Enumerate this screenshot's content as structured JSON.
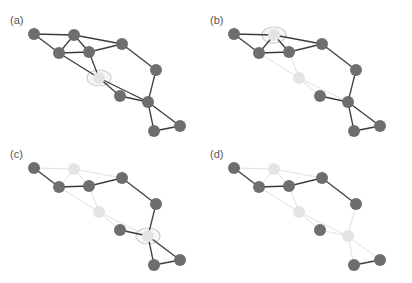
{
  "figure": {
    "colors": {
      "node_active": "#6e6e6e",
      "node_removed": "#e4e4e4",
      "edge_active": "#3c3c3c",
      "edge_removed": "#e0e0e0",
      "highlight_ring": "#cfcfcf"
    },
    "node_radius": 6,
    "base_nodes": {
      "A": [
        34,
        34
      ],
      "B": [
        74,
        35
      ],
      "C": [
        59,
        53
      ],
      "D": [
        89,
        52
      ],
      "E": [
        122,
        44
      ],
      "F": [
        99,
        78
      ],
      "G": [
        156,
        70
      ],
      "H": [
        120,
        96
      ],
      "I": [
        148,
        102
      ],
      "J": [
        180,
        126
      ],
      "K": [
        154,
        131
      ]
    },
    "edges": [
      [
        "A",
        "B"
      ],
      [
        "A",
        "C"
      ],
      [
        "B",
        "C"
      ],
      [
        "B",
        "D"
      ],
      [
        "B",
        "E"
      ],
      [
        "C",
        "D"
      ],
      [
        "D",
        "E"
      ],
      [
        "C",
        "F"
      ],
      [
        "D",
        "F"
      ],
      [
        "E",
        "G"
      ],
      [
        "G",
        "I"
      ],
      [
        "F",
        "I"
      ],
      [
        "F",
        "H"
      ],
      [
        "H",
        "I"
      ],
      [
        "I",
        "J"
      ],
      [
        "I",
        "K"
      ],
      [
        "J",
        "K"
      ]
    ],
    "panels": [
      {
        "label": "(a)",
        "offset": [
          0,
          0
        ],
        "removed": [],
        "highlight": "F"
      },
      {
        "label": "(b)",
        "offset": [
          200,
          0
        ],
        "removed": [
          "F"
        ],
        "highlight": "B"
      },
      {
        "label": "(c)",
        "offset": [
          0,
          134
        ],
        "removed": [
          "F",
          "B"
        ],
        "highlight": "I"
      },
      {
        "label": "(d)",
        "offset": [
          200,
          134
        ],
        "removed": [
          "F",
          "B",
          "I"
        ],
        "highlight": null
      }
    ]
  }
}
